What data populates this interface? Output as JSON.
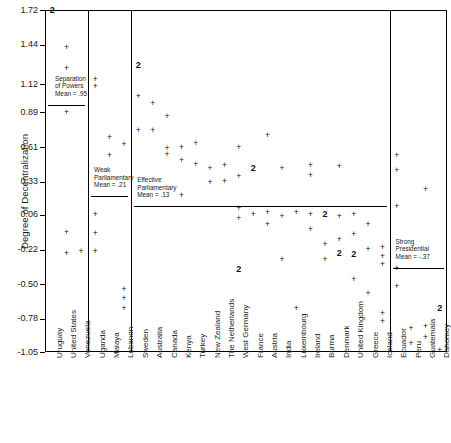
{
  "chart_data": {
    "type": "scatter",
    "title": "",
    "xlabel": "",
    "ylabel": "Degree of Decentralization",
    "ylim": [
      -1.05,
      1.72
    ],
    "grid": false,
    "legend": "none",
    "marker_single": "+",
    "marker_double": "2",
    "ytick_labels": [
      "1.72",
      "1.44",
      "1.12",
      "0.89",
      "0.61",
      "0.33",
      "0.06",
      "-0.22",
      "-0.50",
      "-0.78",
      "-1.05"
    ],
    "ytick_values": [
      1.72,
      1.44,
      1.12,
      0.89,
      0.61,
      0.33,
      0.06,
      -0.22,
      -0.5,
      -0.78,
      -1.05
    ],
    "categories": [
      "Uruguay",
      "United States",
      "Venezuela",
      "Uganda",
      "Malaya",
      "Lebanon",
      "Sweden",
      "Australia",
      "Canada",
      "Kenya",
      "Turkey",
      "New Zealand",
      "The Netherlands",
      "West Germany",
      "France",
      "Austria",
      "India",
      "Luxembourg",
      "Ireland",
      "Burma",
      "Denmark",
      "United Kingdom",
      "Greece",
      "Iceland",
      "Ecuador",
      "Peru",
      "Guatemala",
      "Dahomey"
    ],
    "groups": [
      {
        "name": "Separation of Powers",
        "mean_label": "Mean = .95",
        "mean_value": 0.95,
        "countries": [
          "Uruguay",
          "United States",
          "Venezuela"
        ]
      },
      {
        "name": "Weak Parliamentary",
        "mean_label": "Mean = .21",
        "mean_value": 0.21,
        "countries": [
          "Uganda",
          "Malaya",
          "Lebanon"
        ]
      },
      {
        "name": "Effective Parliamentary",
        "mean_label": "Mean = .13",
        "mean_value": 0.13,
        "countries": [
          "Sweden",
          "Australia",
          "Canada",
          "Kenya",
          "Turkey",
          "New Zealand",
          "The Netherlands",
          "West Germany",
          "France",
          "Austria",
          "India",
          "Luxembourg",
          "Ireland",
          "Burma",
          "Denmark",
          "United Kingdom",
          "Greece",
          "Iceland"
        ]
      },
      {
        "name": "Strong Presidential",
        "mean_label": "Mean = -.37",
        "mean_value": -0.37,
        "countries": [
          "Ecuador",
          "Peru",
          "Guatemala",
          "Dahomey"
        ]
      }
    ],
    "points": [
      {
        "category": "Uruguay",
        "x": 0,
        "y": 1.72,
        "count": 2
      },
      {
        "category": "United States",
        "x": 1,
        "y": 1.42,
        "count": 1
      },
      {
        "category": "United States",
        "x": 1,
        "y": 1.25,
        "count": 1
      },
      {
        "category": "United States",
        "x": 1,
        "y": 0.89,
        "count": 1
      },
      {
        "category": "United States",
        "x": 1,
        "y": -0.08,
        "count": 1
      },
      {
        "category": "United States",
        "x": 1,
        "y": -0.25,
        "count": 1
      },
      {
        "category": "Venezuela",
        "x": 2,
        "y": -0.24,
        "count": 1
      },
      {
        "category": "Uganda",
        "x": 3,
        "y": 1.16,
        "count": 1
      },
      {
        "category": "Uganda",
        "x": 3,
        "y": 1.1,
        "count": 1
      },
      {
        "category": "Uganda",
        "x": 3,
        "y": 0.06,
        "count": 1
      },
      {
        "category": "Uganda",
        "x": 3,
        "y": -0.09,
        "count": 1
      },
      {
        "category": "Uganda",
        "x": 3,
        "y": -0.24,
        "count": 1
      },
      {
        "category": "Malaya",
        "x": 4,
        "y": 0.69,
        "count": 1
      },
      {
        "category": "Malaya",
        "x": 4,
        "y": 0.54,
        "count": 1
      },
      {
        "category": "Lebanon",
        "x": 5,
        "y": 0.63,
        "count": 1
      },
      {
        "category": "Lebanon",
        "x": 5,
        "y": -0.54,
        "count": 1
      },
      {
        "category": "Lebanon",
        "x": 5,
        "y": -0.62,
        "count": 1
      },
      {
        "category": "Lebanon",
        "x": 5,
        "y": -0.7,
        "count": 1
      },
      {
        "category": "Sweden",
        "x": 6,
        "y": 1.27,
        "count": 2
      },
      {
        "category": "Sweden",
        "x": 6,
        "y": 1.02,
        "count": 1
      },
      {
        "category": "Sweden",
        "x": 6,
        "y": 0.74,
        "count": 1
      },
      {
        "category": "Australia",
        "x": 7,
        "y": 0.96,
        "count": 1
      },
      {
        "category": "Australia",
        "x": 7,
        "y": 0.74,
        "count": 1
      },
      {
        "category": "Canada",
        "x": 8,
        "y": 0.86,
        "count": 1
      },
      {
        "category": "Canada",
        "x": 8,
        "y": 0.6,
        "count": 1
      },
      {
        "category": "Canada",
        "x": 8,
        "y": 0.55,
        "count": 1
      },
      {
        "category": "Kenya",
        "x": 9,
        "y": 0.61,
        "count": 1
      },
      {
        "category": "Kenya",
        "x": 9,
        "y": 0.5,
        "count": 1
      },
      {
        "category": "Kenya",
        "x": 9,
        "y": 0.22,
        "count": 1
      },
      {
        "category": "Turkey",
        "x": 10,
        "y": 0.64,
        "count": 1
      },
      {
        "category": "Turkey",
        "x": 10,
        "y": 0.47,
        "count": 1
      },
      {
        "category": "New Zealand",
        "x": 11,
        "y": 0.44,
        "count": 1
      },
      {
        "category": "New Zealand",
        "x": 11,
        "y": 0.32,
        "count": 1
      },
      {
        "category": "The Netherlands",
        "x": 12,
        "y": 0.46,
        "count": 1
      },
      {
        "category": "The Netherlands",
        "x": 12,
        "y": 0.33,
        "count": 1
      },
      {
        "category": "West Germany",
        "x": 13,
        "y": 0.61,
        "count": 1
      },
      {
        "category": "West Germany",
        "x": 13,
        "y": 0.37,
        "count": 1
      },
      {
        "category": "West Germany",
        "x": 13,
        "y": 0.11,
        "count": 1
      },
      {
        "category": "West Germany",
        "x": 13,
        "y": 0.03,
        "count": 1
      },
      {
        "category": "West Germany",
        "x": 13,
        "y": -0.38,
        "count": 2
      },
      {
        "category": "France",
        "x": 14,
        "y": 0.44,
        "count": 2
      },
      {
        "category": "France",
        "x": 14,
        "y": 0.06,
        "count": 1
      },
      {
        "category": "Austria",
        "x": 15,
        "y": 0.7,
        "count": 1
      },
      {
        "category": "Austria",
        "x": 15,
        "y": 0.08,
        "count": 1
      },
      {
        "category": "Austria",
        "x": 15,
        "y": -0.02,
        "count": 1
      },
      {
        "category": "India",
        "x": 16,
        "y": 0.44,
        "count": 1
      },
      {
        "category": "India",
        "x": 16,
        "y": 0.05,
        "count": 1
      },
      {
        "category": "India",
        "x": 16,
        "y": -0.3,
        "count": 1
      },
      {
        "category": "Luxembourg",
        "x": 17,
        "y": 0.08,
        "count": 1
      },
      {
        "category": "Luxembourg",
        "x": 17,
        "y": -0.7,
        "count": 1
      },
      {
        "category": "Ireland",
        "x": 18,
        "y": 0.46,
        "count": 1
      },
      {
        "category": "Ireland",
        "x": 18,
        "y": 0.38,
        "count": 1
      },
      {
        "category": "Ireland",
        "x": 18,
        "y": 0.06,
        "count": 1
      },
      {
        "category": "Ireland",
        "x": 18,
        "y": -0.06,
        "count": 1
      },
      {
        "category": "Burma",
        "x": 19,
        "y": 0.06,
        "count": 2
      },
      {
        "category": "Burma",
        "x": 19,
        "y": -0.18,
        "count": 1
      },
      {
        "category": "Burma",
        "x": 19,
        "y": -0.3,
        "count": 1
      },
      {
        "category": "Denmark",
        "x": 20,
        "y": 0.45,
        "count": 1
      },
      {
        "category": "Denmark",
        "x": 20,
        "y": 0.05,
        "count": 1
      },
      {
        "category": "Denmark",
        "x": 20,
        "y": -0.14,
        "count": 1
      },
      {
        "category": "Denmark",
        "x": 20,
        "y": -0.25,
        "count": 2
      },
      {
        "category": "United Kingdom",
        "x": 21,
        "y": 0.06,
        "count": 1
      },
      {
        "category": "United Kingdom",
        "x": 21,
        "y": -0.1,
        "count": 1
      },
      {
        "category": "United Kingdom",
        "x": 21,
        "y": -0.26,
        "count": 2
      },
      {
        "category": "United Kingdom",
        "x": 21,
        "y": -0.46,
        "count": 1
      },
      {
        "category": "Greece",
        "x": 22,
        "y": -0.02,
        "count": 1
      },
      {
        "category": "Greece",
        "x": 22,
        "y": -0.22,
        "count": 1
      },
      {
        "category": "Greece",
        "x": 22,
        "y": -0.58,
        "count": 1
      },
      {
        "category": "Iceland",
        "x": 23,
        "y": -0.2,
        "count": 1
      },
      {
        "category": "Iceland",
        "x": 23,
        "y": -0.28,
        "count": 1
      },
      {
        "category": "Iceland",
        "x": 23,
        "y": -0.34,
        "count": 1
      },
      {
        "category": "Iceland",
        "x": 23,
        "y": -0.74,
        "count": 1
      },
      {
        "category": "Iceland",
        "x": 23,
        "y": -0.8,
        "count": 1
      },
      {
        "category": "Ecuador",
        "x": 24,
        "y": 0.54,
        "count": 1
      },
      {
        "category": "Ecuador",
        "x": 24,
        "y": 0.42,
        "count": 1
      },
      {
        "category": "Ecuador",
        "x": 24,
        "y": 0.13,
        "count": 1
      },
      {
        "category": "Ecuador",
        "x": 24,
        "y": -0.37,
        "count": 1
      },
      {
        "category": "Ecuador",
        "x": 24,
        "y": -0.52,
        "count": 1
      },
      {
        "category": "Peru",
        "x": 25,
        "y": -0.86,
        "count": 1
      },
      {
        "category": "Peru",
        "x": 25,
        "y": -0.98,
        "count": 1
      },
      {
        "category": "Guatemala",
        "x": 26,
        "y": 0.27,
        "count": 1
      },
      {
        "category": "Guatemala",
        "x": 26,
        "y": -0.84,
        "count": 1
      },
      {
        "category": "Guatemala",
        "x": 26,
        "y": -0.93,
        "count": 1
      },
      {
        "category": "Dahomey",
        "x": 27,
        "y": -0.7,
        "count": 2
      },
      {
        "category": "Dahomey",
        "x": 27,
        "y": -1.04,
        "count": 1
      }
    ]
  }
}
